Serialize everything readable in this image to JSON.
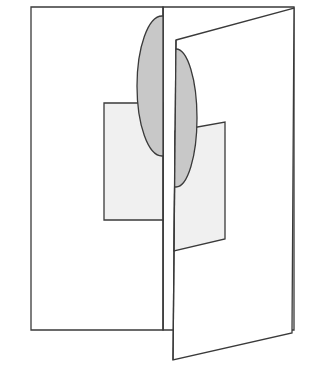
{
  "diagram": {
    "colors": {
      "background": "#ffffff",
      "stroke": "#3a3a3a",
      "ellipse_fill": "#c8c8c8",
      "rect_fill": "#f0f0f0",
      "page_fill": "#ffffff"
    },
    "left_page": {
      "points": "31,7 163,7 163,330 31,330"
    },
    "left_rect": {
      "points": "104,103 163,103 163,220 104,220"
    },
    "left_ellipse": {
      "cx": 162,
      "cy": 86,
      "rx": 25,
      "ry": 70
    },
    "spine": {
      "x1": 163,
      "y1": 7,
      "x2": 163,
      "y2": 330
    },
    "back_right_page": {
      "points": "163,7 294,7 294,330 163,330"
    },
    "right_flap": {
      "points": "176,40 294,8 292,333 173,360"
    },
    "right_rect": {
      "points": "175,131 225,122 225,239 174,251"
    },
    "right_ellipse": {
      "cx": 176,
      "cy": 118,
      "rx": 21,
      "ry": 69
    }
  }
}
